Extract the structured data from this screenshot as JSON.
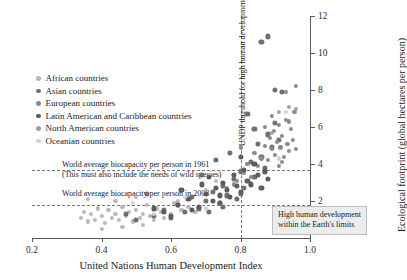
{
  "chart_data": {
    "type": "scatter",
    "title": "",
    "xlabel": "United Nations Human Development Index",
    "ylabel": "Ecological footprint (global hectares per person)",
    "xlim": [
      0.2,
      1.0
    ],
    "ylim": [
      0,
      12
    ],
    "xticks": [
      "0.2",
      "0.4",
      "0.6",
      "0.8",
      "1.0"
    ],
    "xtick_values": [
      0.2,
      0.4,
      0.6,
      0.8,
      1.0
    ],
    "yticks": [
      "2",
      "4",
      "6",
      "8",
      "10",
      "12"
    ],
    "ytick_values": [
      2,
      4,
      6,
      8,
      10,
      12
    ],
    "grid": false,
    "legend_position": "upper-left",
    "legend": [
      {
        "name": "African countries",
        "color": "#b9b9b9"
      },
      {
        "name": "Asian countries",
        "color": "#6f6f6f"
      },
      {
        "name": "European countries",
        "color": "#8a8a8a"
      },
      {
        "name": "Latin American and Caribbean countries",
        "color": "#5c5c5c"
      },
      {
        "name": "North American countries",
        "color": "#a0a0a0"
      },
      {
        "name": "Oceanian countries",
        "color": "#d2d2d2"
      }
    ],
    "reference_lines": [
      {
        "name": "biocapacity-1961",
        "orientation": "horizontal",
        "value": 3.7,
        "label": "World average biocapacity per person in 1961",
        "sublabel": "(This must also include the needs of wild species)"
      },
      {
        "name": "biocapacity-2008",
        "orientation": "horizontal",
        "value": 1.8,
        "label": "World average biocapacity per person in 2008",
        "sublabel": ""
      },
      {
        "name": "undp-threshold",
        "orientation": "vertical",
        "value": 0.8,
        "label": "UNDP threshold for high human development",
        "sublabel": ""
      }
    ],
    "annotations": [
      {
        "name": "sustainable-quadrant",
        "line1": "High human development",
        "line2": "within the Earth's limits"
      }
    ],
    "series": [
      {
        "name": "African countries",
        "color": "#b9b9b9",
        "points": [
          [
            0.34,
            1.1
          ],
          [
            0.35,
            1.4
          ],
          [
            0.36,
            0.9
          ],
          [
            0.37,
            1.3
          ],
          [
            0.38,
            1.0
          ],
          [
            0.39,
            1.6
          ],
          [
            0.4,
            1.2
          ],
          [
            0.41,
            0.8
          ],
          [
            0.42,
            1.5
          ],
          [
            0.43,
            1.1
          ],
          [
            0.44,
            1.3
          ],
          [
            0.45,
            1.0
          ],
          [
            0.46,
            1.7
          ],
          [
            0.47,
            1.2
          ],
          [
            0.48,
            1.4
          ],
          [
            0.49,
            0.9
          ],
          [
            0.5,
            1.5
          ],
          [
            0.51,
            1.1
          ],
          [
            0.52,
            1.3
          ],
          [
            0.53,
            1.8
          ],
          [
            0.54,
            1.2
          ],
          [
            0.55,
            1.0
          ],
          [
            0.56,
            1.6
          ],
          [
            0.57,
            1.4
          ],
          [
            0.58,
            1.1
          ],
          [
            0.6,
            1.3
          ],
          [
            0.61,
            1.9
          ],
          [
            0.63,
            1.5
          ],
          [
            0.65,
            1.7
          ],
          [
            0.67,
            1.4
          ],
          [
            0.36,
            2.1
          ],
          [
            0.44,
            2.0
          ],
          [
            0.5,
            2.2
          ],
          [
            0.7,
            2.6
          ],
          [
            0.73,
            3.1
          ],
          [
            0.52,
            0.7
          ],
          [
            0.46,
            0.6
          ],
          [
            0.4,
            0.5
          ],
          [
            0.58,
            2.4
          ],
          [
            0.62,
            2.0
          ]
        ]
      },
      {
        "name": "Asian countries",
        "color": "#6f6f6f",
        "points": [
          [
            0.5,
            1.0
          ],
          [
            0.55,
            1.2
          ],
          [
            0.58,
            1.5
          ],
          [
            0.6,
            1.1
          ],
          [
            0.62,
            1.8
          ],
          [
            0.64,
            1.4
          ],
          [
            0.66,
            2.2
          ],
          [
            0.68,
            1.6
          ],
          [
            0.7,
            2.0
          ],
          [
            0.72,
            2.5
          ],
          [
            0.74,
            1.9
          ],
          [
            0.75,
            2.8
          ],
          [
            0.76,
            2.3
          ],
          [
            0.78,
            3.2
          ],
          [
            0.79,
            2.1
          ],
          [
            0.8,
            3.6
          ],
          [
            0.81,
            2.7
          ],
          [
            0.83,
            4.1
          ],
          [
            0.84,
            3.3
          ],
          [
            0.85,
            5.1
          ],
          [
            0.86,
            4.4
          ],
          [
            0.87,
            3.8
          ],
          [
            0.88,
            5.6
          ],
          [
            0.89,
            4.9
          ],
          [
            0.9,
            6.2
          ],
          [
            0.91,
            5.3
          ],
          [
            0.77,
            4.6
          ],
          [
            0.82,
            6.7
          ],
          [
            0.9,
            8.0
          ],
          [
            0.92,
            7.9
          ],
          [
            0.47,
            1.3
          ],
          [
            0.53,
            2.4
          ],
          [
            0.69,
            3.4
          ],
          [
            0.73,
            4.2
          ],
          [
            0.86,
            10.6
          ],
          [
            0.88,
            10.9
          ],
          [
            0.84,
            5.9
          ],
          [
            0.8,
            2.4
          ],
          [
            0.75,
            1.7
          ],
          [
            0.71,
            1.4
          ]
        ]
      },
      {
        "name": "European countries",
        "color": "#8a8a8a",
        "points": [
          [
            0.79,
            3.1
          ],
          [
            0.81,
            3.5
          ],
          [
            0.82,
            4.0
          ],
          [
            0.83,
            3.3
          ],
          [
            0.84,
            4.6
          ],
          [
            0.85,
            3.9
          ],
          [
            0.86,
            4.3
          ],
          [
            0.87,
            5.0
          ],
          [
            0.88,
            4.2
          ],
          [
            0.885,
            5.4
          ],
          [
            0.89,
            4.8
          ],
          [
            0.895,
            5.8
          ],
          [
            0.9,
            4.5
          ],
          [
            0.905,
            5.2
          ],
          [
            0.91,
            6.1
          ],
          [
            0.915,
            4.9
          ],
          [
            0.92,
            5.5
          ],
          [
            0.925,
            4.4
          ],
          [
            0.93,
            6.4
          ],
          [
            0.935,
            5.1
          ],
          [
            0.94,
            4.7
          ],
          [
            0.945,
            5.9
          ],
          [
            0.95,
            5.3
          ],
          [
            0.955,
            6.8
          ],
          [
            0.96,
            4.8
          ],
          [
            0.78,
            2.9
          ],
          [
            0.8,
            4.9
          ],
          [
            0.76,
            2.7
          ],
          [
            0.93,
            7.9
          ],
          [
            0.96,
            8.2
          ],
          [
            0.91,
            3.9
          ],
          [
            0.89,
            6.6
          ],
          [
            0.87,
            6.0
          ],
          [
            0.94,
            6.3
          ],
          [
            0.92,
            4.1
          ]
        ]
      },
      {
        "name": "Latin American and Caribbean countries",
        "color": "#5c5c5c",
        "points": [
          [
            0.58,
            1.4
          ],
          [
            0.62,
            1.8
          ],
          [
            0.65,
            2.1
          ],
          [
            0.68,
            1.7
          ],
          [
            0.7,
            2.4
          ],
          [
            0.72,
            2.0
          ],
          [
            0.73,
            2.7
          ],
          [
            0.74,
            2.3
          ],
          [
            0.75,
            3.0
          ],
          [
            0.76,
            2.6
          ],
          [
            0.77,
            2.2
          ],
          [
            0.78,
            3.4
          ],
          [
            0.79,
            2.8
          ],
          [
            0.8,
            2.5
          ],
          [
            0.81,
            3.7
          ],
          [
            0.82,
            3.1
          ],
          [
            0.83,
            2.9
          ],
          [
            0.84,
            4.0
          ],
          [
            0.85,
            3.4
          ],
          [
            0.86,
            2.7
          ],
          [
            0.87,
            3.6
          ],
          [
            0.71,
            3.3
          ],
          [
            0.66,
            1.5
          ],
          [
            0.6,
            1.2
          ],
          [
            0.63,
            2.6
          ],
          [
            0.88,
            3.2
          ],
          [
            0.69,
            2.9
          ],
          [
            0.74,
            1.9
          ],
          [
            0.8,
            4.4
          ],
          [
            0.55,
            1.6
          ]
        ]
      },
      {
        "name": "North American countries",
        "color": "#a0a0a0",
        "points": [
          [
            0.91,
            6.8
          ],
          [
            0.94,
            7.1
          ],
          [
            0.96,
            7.0
          ],
          [
            0.89,
            5.7
          ]
        ]
      },
      {
        "name": "Oceanian countries",
        "color": "#d2d2d2",
        "points": [
          [
            0.93,
            6.8
          ],
          [
            0.91,
            4.3
          ],
          [
            0.49,
            1.9
          ],
          [
            0.64,
            2.2
          ],
          [
            0.7,
            1.6
          ],
          [
            0.55,
            1.3
          ]
        ]
      }
    ]
  }
}
